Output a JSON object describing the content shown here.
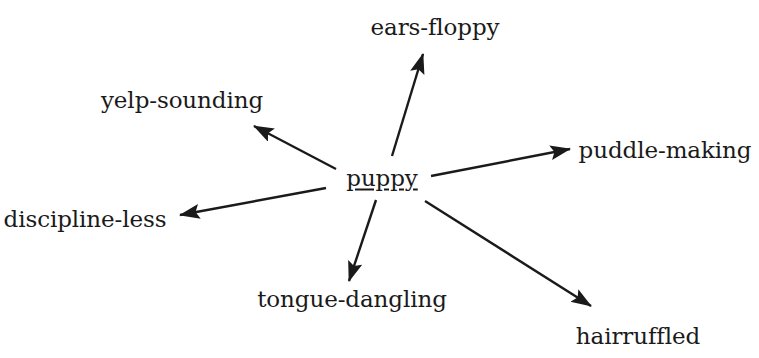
{
  "diagram": {
    "type": "radial-word-web",
    "center": {
      "id": "center-node",
      "label": "puppy",
      "underlined": true,
      "x": 382,
      "y": 178
    },
    "ink_color": "#1a1a1a",
    "background_color": "#ffffff",
    "branches": [
      {
        "id": "branch-ears-floppy",
        "label": "ears-floppy",
        "label_x": 435,
        "label_y": 27,
        "anchor": "middle",
        "arrow": {
          "x1": 392,
          "y1": 156,
          "x2": 423,
          "y2": 54
        }
      },
      {
        "id": "branch-yelp-sounding",
        "label": "yelp-sounding",
        "label_x": 182,
        "label_y": 100,
        "anchor": "middle",
        "arrow": {
          "x1": 336,
          "y1": 169,
          "x2": 254,
          "y2": 126
        }
      },
      {
        "id": "branch-puddle-making",
        "label": "puddle-making",
        "label_x": 665,
        "label_y": 150,
        "anchor": "middle",
        "arrow": {
          "x1": 431,
          "y1": 176,
          "x2": 570,
          "y2": 149
        }
      },
      {
        "id": "branch-discipline-less",
        "label": "discipline-less",
        "label_x": 85,
        "label_y": 219,
        "anchor": "middle",
        "arrow": {
          "x1": 326,
          "y1": 188,
          "x2": 180,
          "y2": 215
        }
      },
      {
        "id": "branch-tongue-dangling",
        "label": "tongue-dangling",
        "label_x": 352,
        "label_y": 299,
        "anchor": "middle",
        "arrow": {
          "x1": 376,
          "y1": 200,
          "x2": 349,
          "y2": 281
        }
      },
      {
        "id": "branch-hairruffled",
        "label": "hairruffled",
        "label_x": 638,
        "label_y": 336,
        "anchor": "middle",
        "arrow": {
          "x1": 425,
          "y1": 201,
          "x2": 591,
          "y2": 306
        }
      }
    ]
  }
}
